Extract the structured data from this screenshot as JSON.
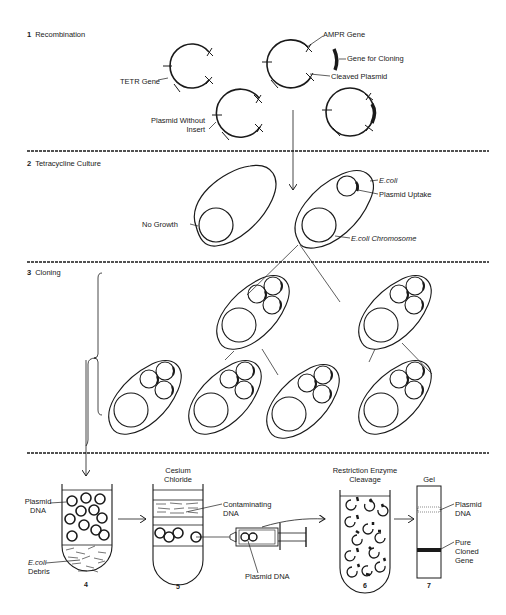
{
  "sections": [
    {
      "number": "1",
      "title": "Recombination"
    },
    {
      "number": "2",
      "title": "Tetracycline Culture"
    },
    {
      "number": "3",
      "title": "Cloning"
    }
  ],
  "recombination": {
    "labels": {
      "amp_gene": "AMPR Gene",
      "gene_for_cloning": "Gene for Cloning",
      "cleaved_plasmid": "Cleaved Plasmid",
      "tet_gene": "TETR Gene",
      "plasmid_without_insert_1": "Plasmid Without",
      "plasmid_without_insert_2": "Insert"
    }
  },
  "culture": {
    "labels": {
      "no_growth": "No Growth",
      "ecoli": "E.coli",
      "plasmid_uptake": "Plasmid Uptake",
      "ecoli_chromosome": "E.coli Chromosome"
    }
  },
  "purification": {
    "steps": [
      {
        "number": "4"
      },
      {
        "number": "5",
        "heading_1": "Cesium",
        "heading_2": "Chloride"
      },
      {
        "number": "6",
        "heading_1": "Restriction Enzyme",
        "heading_2": "Cleavage"
      },
      {
        "number": "7",
        "heading_1": "Gel"
      }
    ],
    "labels": {
      "plasmid_dna_1": "Plasmid",
      "plasmid_dna_2": "DNA",
      "ecoli_debris_1": "E.coli",
      "ecoli_debris_2": "Debris",
      "contaminating_1": "Contaminating",
      "contaminating_2": "DNA",
      "syringe_plasmid": "Plasmid DNA",
      "gel_plasmid_1": "Plasmid",
      "gel_plasmid_2": "DNA",
      "pure_1": "Pure",
      "pure_2": "Cloned",
      "pure_3": "Gene"
    }
  },
  "colors": {
    "ink": "#1a1a1a",
    "background": "#ffffff"
  }
}
